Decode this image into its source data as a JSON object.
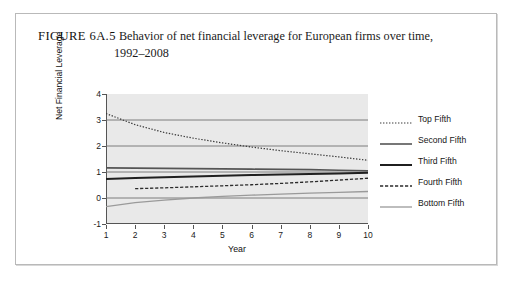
{
  "figure": {
    "label": "FIGURE 6A.5",
    "caption_line1": "Behavior of net financial leverage for European firms over time,",
    "caption_line2": "1992–2008"
  },
  "chart_data": {
    "type": "line",
    "title": "Behavior of net financial leverage for European firms over time, 1992–2008",
    "xlabel": "Year",
    "ylabel": "Net Financial Leverage",
    "xlim": [
      1,
      10
    ],
    "ylim": [
      -1,
      4
    ],
    "yticks": [
      -1,
      0,
      1,
      2,
      3,
      4
    ],
    "xticks": [
      1,
      2,
      3,
      4,
      5,
      6,
      7,
      8,
      9,
      10
    ],
    "grid": "horizontal",
    "legend_position": "right",
    "x": [
      1,
      2,
      3,
      4,
      5,
      6,
      7,
      8,
      9,
      10
    ],
    "series": [
      {
        "name": "Top Fifth",
        "style": "dotted",
        "color": "#3a3a3a",
        "width": 1.2,
        "values": [
          3.25,
          2.82,
          2.52,
          2.3,
          2.12,
          1.96,
          1.82,
          1.7,
          1.58,
          1.45
        ]
      },
      {
        "name": "Second Fifth",
        "style": "solid",
        "color": "#555555",
        "width": 1.6,
        "values": [
          1.16,
          1.15,
          1.14,
          1.13,
          1.12,
          1.11,
          1.1,
          1.09,
          1.07,
          1.05
        ]
      },
      {
        "name": "Third Fifth",
        "style": "solid",
        "color": "#1f1f1f",
        "width": 2.0,
        "values": [
          0.73,
          0.77,
          0.8,
          0.83,
          0.86,
          0.88,
          0.9,
          0.92,
          0.94,
          0.97
        ]
      },
      {
        "name": "Fourth Fifth",
        "style": "dashed",
        "color": "#2b2b2b",
        "width": 1.3,
        "values": [
          null,
          0.36,
          0.39,
          0.43,
          0.47,
          0.51,
          0.56,
          0.62,
          0.69,
          0.76
        ]
      },
      {
        "name": "Bottom Fifth",
        "style": "solid",
        "color": "#9a9a9a",
        "width": 1.3,
        "values": [
          -0.33,
          -0.18,
          -0.08,
          0.0,
          0.06,
          0.11,
          0.15,
          0.19,
          0.22,
          0.25
        ]
      }
    ]
  },
  "legend": {
    "items": [
      {
        "label": "Top Fifth"
      },
      {
        "label": "Second Fifth"
      },
      {
        "label": "Third Fifth"
      },
      {
        "label": "Fourth Fifth"
      },
      {
        "label": "Bottom Fifth"
      }
    ]
  }
}
